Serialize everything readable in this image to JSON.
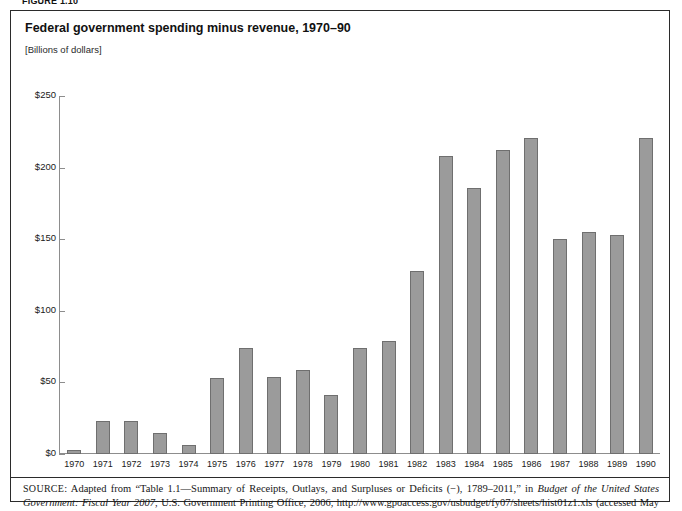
{
  "figure": {
    "label": "FIGURE 1.10"
  },
  "chart": {
    "title": "Federal government spending minus revenue, 1970–90",
    "unit_label": "[Billions of dollars]"
  },
  "source": {
    "prefix": "SOURCE",
    "text_1": ": Adapted from “Table 1.1—Summary of Receipts, Outlays, and Surpluses or Deficits (−), 1789–2011,” in ",
    "italic_1": "Budget of the United States Government: Fiscal Year 2007",
    "text_2": ", U.S. Government Printing Office, 2006, http://www.gpoaccess.gov/usbudget/fy07/sheets/hist01z1.xls (accessed May 18, 2006)"
  },
  "chart_data": {
    "type": "bar",
    "title": "Federal government spending minus revenue, 1970–90",
    "subtitle": "[Billions of dollars]",
    "xlabel": "",
    "ylabel": "Billions of dollars",
    "ylim": [
      0,
      250
    ],
    "ytick_labels": [
      "$0",
      "$50",
      "$100",
      "$150",
      "$200",
      "$250"
    ],
    "ytick_values": [
      0,
      50,
      100,
      150,
      200,
      250
    ],
    "grid": false,
    "legend": "none",
    "bar_color": "#9b9b9b",
    "bar_border_color": "#6f6f6f",
    "categories": [
      "1970",
      "1971",
      "1972",
      "1973",
      "1974",
      "1975",
      "1976",
      "1977",
      "1978",
      "1979",
      "1980",
      "1981",
      "1982",
      "1983",
      "1984",
      "1985",
      "1986",
      "1987",
      "1988",
      "1989",
      "1990"
    ],
    "values": [
      3,
      23,
      23,
      15,
      6,
      53,
      74,
      54,
      59,
      41,
      74,
      79,
      128,
      208,
      186,
      212,
      221,
      150,
      155,
      153,
      221
    ]
  }
}
